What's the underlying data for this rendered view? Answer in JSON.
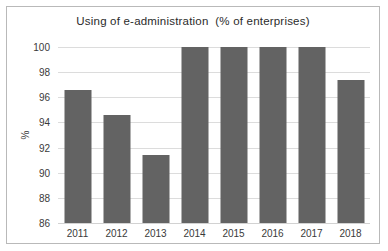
{
  "chart_data": {
    "type": "bar",
    "title": "Using of e-administration  (% of enterprises)",
    "xlabel": "",
    "ylabel": "%",
    "categories": [
      "2011",
      "2012",
      "2013",
      "2014",
      "2015",
      "2016",
      "2017",
      "2018"
    ],
    "values": [
      96.6,
      94.6,
      91.4,
      100,
      100,
      100,
      100,
      97.4
    ],
    "ylim": [
      86,
      100
    ],
    "ytick_labels": [
      "86",
      "88",
      "90",
      "92",
      "94",
      "96",
      "98",
      "100"
    ],
    "ytick_values": [
      86,
      88,
      90,
      92,
      94,
      96,
      98,
      100
    ],
    "grid": true,
    "legend": false,
    "bar_color": "#636363",
    "gridline_color": "#dcdcdc",
    "border_color": "#b9b9b9"
  }
}
